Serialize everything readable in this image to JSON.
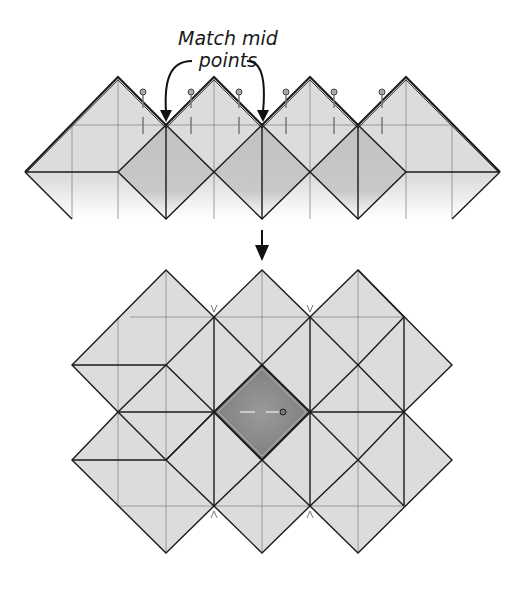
{
  "annotation": {
    "line1": "Match mid",
    "line2": "points"
  },
  "colors": {
    "fabric_light": "#dcdcdc",
    "fabric_medium": "#c4c4c4",
    "center_square": "#8a8a8a",
    "outline": "#1a1a1a",
    "guide_line": "#888888"
  },
  "top_step": {
    "description": "Row of blocks pinned at matching midpoints",
    "peaks_count": 4,
    "pins_count": 6
  },
  "bottom_step": {
    "description": "Assembled block arrangement with dark center square"
  }
}
